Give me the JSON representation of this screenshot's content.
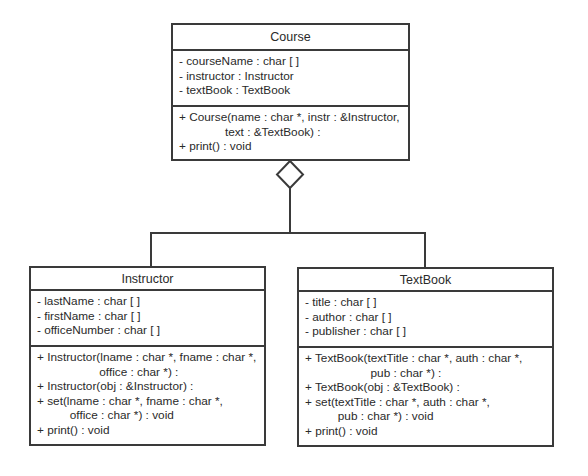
{
  "diagram": {
    "type": "UML class diagram (aggregation)",
    "relationship": "aggregation",
    "aggregate_class": "Course",
    "part_classes": [
      "Instructor",
      "TextBook"
    ]
  },
  "classes": {
    "course": {
      "name": "Course",
      "attributes": [
        "- courseName : char [ ]",
        "- instructor : Instructor",
        "- textBook : TextBook"
      ],
      "methods": [
        "+ Course(name : char *, instr : &Instructor,",
        "              text : &TextBook) :",
        "+ print() : void"
      ]
    },
    "instructor": {
      "name": "Instructor",
      "attributes": [
        "- lastName : char [ ]",
        "- firstName : char [ ]",
        "- officeNumber : char [ ]"
      ],
      "methods": [
        "+ Instructor(lname : char *, fname : char *,",
        "                   office : char *) :",
        "+ Instructor(obj : &Instructor) :",
        "+ set(lname : char *, fname : char *,",
        "          office : char *) : void",
        "+ print() : void"
      ]
    },
    "textbook": {
      "name": "TextBook",
      "attributes": [
        "- title : char [ ]",
        "- author : char [ ]",
        "- publisher : char [ ]"
      ],
      "methods": [
        "+ TextBook(textTitle : char *, auth : char *,",
        "                    pub : char *) :",
        "+ TextBook(obj : &TextBook) :",
        "+ set(textTitle : char *, auth : char *,",
        "          pub : char *) : void",
        "+ print() : void"
      ]
    }
  },
  "colors": {
    "line": "#3a3a3a",
    "text": "#2a2a2a",
    "background": "#ffffff"
  }
}
